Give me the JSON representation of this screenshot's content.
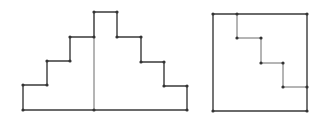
{
  "diagram": {
    "colors": {
      "stroke": "#3a3a3a",
      "inner_stroke": "#6a6a6a",
      "vertex": "#333333",
      "background": "#ffffff"
    },
    "figures": [
      {
        "name": "stepped-pyramid",
        "outline": [
          [
            23,
            110
          ],
          [
            23,
            85
          ],
          [
            47,
            85
          ],
          [
            47,
            61
          ],
          [
            70,
            61
          ],
          [
            70,
            37
          ],
          [
            94,
            37
          ],
          [
            94,
            12
          ],
          [
            117,
            12
          ],
          [
            117,
            37
          ],
          [
            141,
            37
          ],
          [
            141,
            62
          ],
          [
            164,
            62
          ],
          [
            164,
            86
          ],
          [
            187,
            86
          ],
          [
            187,
            110
          ]
        ],
        "divider": [
          [
            94,
            12
          ],
          [
            94,
            110
          ]
        ],
        "vertices": [
          [
            23,
            110
          ],
          [
            23,
            85
          ],
          [
            47,
            85
          ],
          [
            47,
            61
          ],
          [
            70,
            61
          ],
          [
            70,
            37
          ],
          [
            94,
            37
          ],
          [
            94,
            12
          ],
          [
            117,
            12
          ],
          [
            117,
            37
          ],
          [
            141,
            37
          ],
          [
            141,
            62
          ],
          [
            164,
            62
          ],
          [
            164,
            86
          ],
          [
            187,
            86
          ],
          [
            187,
            110
          ],
          [
            94,
            110
          ]
        ]
      },
      {
        "name": "square-with-staircase",
        "square": [
          [
            213,
            14
          ],
          [
            307,
            14
          ],
          [
            307,
            111
          ],
          [
            213,
            111
          ]
        ],
        "staircase": [
          [
            237,
            14
          ],
          [
            237,
            38
          ],
          [
            261,
            38
          ],
          [
            261,
            63
          ],
          [
            283,
            63
          ],
          [
            283,
            87
          ],
          [
            307,
            87
          ]
        ],
        "vertices": [
          [
            213,
            14
          ],
          [
            237,
            14
          ],
          [
            307,
            14
          ],
          [
            237,
            38
          ],
          [
            261,
            38
          ],
          [
            261,
            63
          ],
          [
            283,
            63
          ],
          [
            283,
            87
          ],
          [
            307,
            87
          ],
          [
            213,
            111
          ],
          [
            307,
            111
          ]
        ]
      }
    ]
  }
}
